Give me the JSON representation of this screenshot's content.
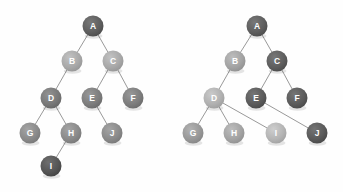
{
  "figure": {
    "background_color": "#fefefe",
    "edge_color": "#8d8d8d",
    "label_color": "#ffffff",
    "node_radius": 10.5,
    "trees": [
      {
        "id": "left-tree",
        "name": "binary-tree",
        "nodes": [
          {
            "id": "A",
            "label": "A",
            "x": 93,
            "y": 26,
            "color": "#5e5e5e"
          },
          {
            "id": "B",
            "label": "B",
            "x": 72,
            "y": 61,
            "color": "#a8a8a8"
          },
          {
            "id": "C",
            "label": "C",
            "x": 113,
            "y": 61,
            "color": "#a8a8a8"
          },
          {
            "id": "D",
            "label": "D",
            "x": 51,
            "y": 98,
            "color": "#787878"
          },
          {
            "id": "E",
            "label": "E",
            "x": 92,
            "y": 98,
            "color": "#7d7d7d"
          },
          {
            "id": "F",
            "label": "F",
            "x": 133,
            "y": 98,
            "color": "#7d7d7d"
          },
          {
            "id": "G",
            "label": "G",
            "x": 30,
            "y": 133,
            "color": "#8a8a8a"
          },
          {
            "id": "H",
            "label": "H",
            "x": 71,
            "y": 133,
            "color": "#8a8a8a"
          },
          {
            "id": "J",
            "label": "J",
            "x": 112,
            "y": 133,
            "color": "#8a8a8a"
          },
          {
            "id": "I",
            "label": "I",
            "x": 51,
            "y": 166,
            "color": "#555555"
          }
        ],
        "edges": [
          {
            "from": "A",
            "to": "B"
          },
          {
            "from": "A",
            "to": "C"
          },
          {
            "from": "B",
            "to": "D"
          },
          {
            "from": "C",
            "to": "E"
          },
          {
            "from": "C",
            "to": "F"
          },
          {
            "from": "D",
            "to": "G"
          },
          {
            "from": "D",
            "to": "H"
          },
          {
            "from": "E",
            "to": "J"
          },
          {
            "from": "H",
            "to": "I"
          }
        ]
      },
      {
        "id": "right-tree",
        "name": "general-tree",
        "nodes": [
          {
            "id": "A",
            "label": "A",
            "x": 257,
            "y": 26,
            "color": "#5e5e5e"
          },
          {
            "id": "B",
            "label": "B",
            "x": 235,
            "y": 61,
            "color": "#a3a3a3"
          },
          {
            "id": "C",
            "label": "C",
            "x": 277,
            "y": 61,
            "color": "#5e5e5e"
          },
          {
            "id": "D",
            "label": "D",
            "x": 214,
            "y": 98,
            "color": "#b0b0b0"
          },
          {
            "id": "E",
            "label": "E",
            "x": 256,
            "y": 98,
            "color": "#5b5b5b"
          },
          {
            "id": "F",
            "label": "F",
            "x": 297,
            "y": 98,
            "color": "#5b5b5b"
          },
          {
            "id": "G",
            "label": "G",
            "x": 193,
            "y": 133,
            "color": "#989898"
          },
          {
            "id": "H",
            "label": "H",
            "x": 234,
            "y": 133,
            "color": "#a3a3a3"
          },
          {
            "id": "I",
            "label": "I",
            "x": 276,
            "y": 133,
            "color": "#b4b4b4"
          },
          {
            "id": "J",
            "label": "J",
            "x": 317,
            "y": 133,
            "color": "#5a5a5a"
          }
        ],
        "edges": [
          {
            "from": "A",
            "to": "B"
          },
          {
            "from": "A",
            "to": "C"
          },
          {
            "from": "B",
            "to": "D"
          },
          {
            "from": "C",
            "to": "E"
          },
          {
            "from": "C",
            "to": "F"
          },
          {
            "from": "D",
            "to": "G"
          },
          {
            "from": "D",
            "to": "H"
          },
          {
            "from": "D",
            "to": "I"
          },
          {
            "from": "E",
            "to": "J"
          }
        ]
      }
    ]
  }
}
